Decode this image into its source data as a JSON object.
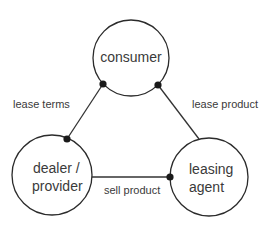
{
  "diagram": {
    "type": "relationship-triangle",
    "nodes": [
      {
        "id": "consumer",
        "lines": [
          "consumer"
        ]
      },
      {
        "id": "dealer",
        "lines": [
          "dealer /",
          "provider"
        ]
      },
      {
        "id": "leasing_agent",
        "lines": [
          "leasing",
          "agent"
        ]
      }
    ],
    "edges": [
      {
        "from": "dealer",
        "to": "consumer",
        "label": "lease terms"
      },
      {
        "from": "leasing_agent",
        "to": "consumer",
        "label": "lease product"
      },
      {
        "from": "dealer",
        "to": "leasing_agent",
        "label": "sell product"
      }
    ]
  },
  "colors": {
    "stroke": "#2b2b2b",
    "text": "#3a3a3a",
    "dot": "#1a1a1a",
    "background": "#ffffff"
  }
}
